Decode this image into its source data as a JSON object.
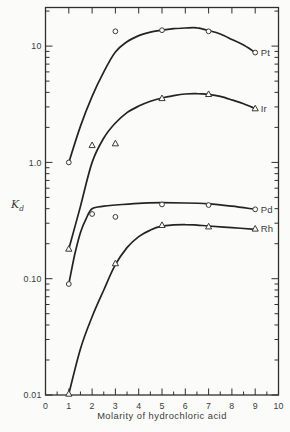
{
  "figure": {
    "background": "#fbfbfa",
    "frame_color": "#2f2f2f",
    "curve_color": "#232323",
    "text_color": "#3a3a3a"
  },
  "y_axis": {
    "label_letter": "K",
    "label_subscript": "d",
    "scale": "log",
    "tick_labels": [
      {
        "text": "10",
        "value": 10
      },
      {
        "text": "1.0",
        "value": 1
      },
      {
        "text": "0.10",
        "value": 0.1
      },
      {
        "text": "0.01",
        "value": 0.01
      }
    ]
  },
  "x_axis": {
    "tick_labels": [
      "0",
      "1",
      "2",
      "3",
      "4",
      "5",
      "6",
      "7",
      "8",
      "9",
      "10"
    ],
    "minor_tick_step": 0.5
  },
  "chart_data": {
    "type": "line",
    "title": "",
    "xlabel": "Molarity of hydrochloric acid",
    "ylabel": "Kd",
    "x_scale": "linear",
    "y_scale": "log",
    "xlim": [
      0,
      10
    ],
    "ylim": [
      0.01,
      21.5
    ],
    "grid": false,
    "legend_position": "right-of-curve-ends",
    "series": [
      {
        "name": "Pt",
        "label": "Pt",
        "marker": "circle",
        "points": [
          [
            1,
            1.0
          ],
          [
            3,
            13.4
          ],
          [
            5,
            13.7
          ],
          [
            7,
            13.4
          ],
          [
            9,
            8.8
          ]
        ],
        "curve": [
          [
            1,
            1.0
          ],
          [
            1.5,
            2.05
          ],
          [
            2,
            3.7
          ],
          [
            2.5,
            6.0
          ],
          [
            3,
            8.9
          ],
          [
            3.5,
            10.9
          ],
          [
            4,
            12.3
          ],
          [
            4.5,
            13.2
          ],
          [
            5,
            13.7
          ],
          [
            5.5,
            14.1
          ],
          [
            6,
            14.3
          ],
          [
            6.5,
            14.35
          ],
          [
            7,
            13.6
          ],
          [
            7.5,
            12.7
          ],
          [
            8,
            11.4
          ],
          [
            8.5,
            10.2
          ],
          [
            9,
            8.8
          ]
        ]
      },
      {
        "name": "Ir",
        "label": "Ir",
        "marker": "triangle",
        "points": [
          [
            1,
            0.18
          ],
          [
            2,
            1.4
          ],
          [
            3,
            1.45
          ],
          [
            5,
            3.55
          ],
          [
            7,
            3.85
          ],
          [
            9,
            2.9
          ]
        ],
        "curve": [
          [
            1,
            0.18
          ],
          [
            1.5,
            0.42
          ],
          [
            2,
            1.0
          ],
          [
            2.5,
            1.62
          ],
          [
            3,
            2.18
          ],
          [
            3.5,
            2.68
          ],
          [
            4,
            3.05
          ],
          [
            4.5,
            3.35
          ],
          [
            5,
            3.58
          ],
          [
            5.5,
            3.75
          ],
          [
            6,
            3.87
          ],
          [
            6.5,
            3.9
          ],
          [
            7,
            3.85
          ],
          [
            7.5,
            3.7
          ],
          [
            8,
            3.45
          ],
          [
            8.5,
            3.2
          ],
          [
            9,
            2.9
          ]
        ]
      },
      {
        "name": "Pd",
        "label": "Pd",
        "marker": "circle",
        "points": [
          [
            1,
            0.09
          ],
          [
            2,
            0.36
          ],
          [
            3,
            0.34
          ],
          [
            5,
            0.435
          ],
          [
            7,
            0.43
          ],
          [
            9,
            0.395
          ]
        ],
        "curve": [
          [
            1,
            0.09
          ],
          [
            1.25,
            0.16
          ],
          [
            1.5,
            0.25
          ],
          [
            1.75,
            0.33
          ],
          [
            2,
            0.4
          ],
          [
            2.5,
            0.42
          ],
          [
            3,
            0.43
          ],
          [
            4,
            0.445
          ],
          [
            5,
            0.45
          ],
          [
            6,
            0.448
          ],
          [
            7,
            0.44
          ],
          [
            8,
            0.42
          ],
          [
            9,
            0.395
          ]
        ]
      },
      {
        "name": "Rh",
        "label": "Rh",
        "marker": "triangle",
        "points": [
          [
            1,
            0.0102
          ],
          [
            3,
            0.135
          ],
          [
            5,
            0.288
          ],
          [
            7,
            0.28
          ],
          [
            9,
            0.268
          ]
        ],
        "curve": [
          [
            1,
            0.0102
          ],
          [
            1.5,
            0.025
          ],
          [
            2,
            0.047
          ],
          [
            2.5,
            0.08
          ],
          [
            3,
            0.132
          ],
          [
            3.5,
            0.185
          ],
          [
            4,
            0.23
          ],
          [
            4.5,
            0.262
          ],
          [
            5,
            0.283
          ],
          [
            5.5,
            0.29
          ],
          [
            6,
            0.292
          ],
          [
            6.5,
            0.289
          ],
          [
            7,
            0.284
          ],
          [
            8,
            0.275
          ],
          [
            9,
            0.266
          ]
        ]
      }
    ]
  }
}
